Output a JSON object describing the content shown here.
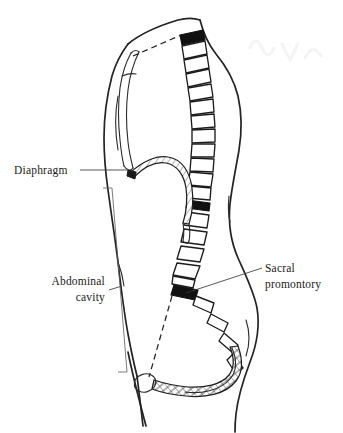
{
  "figure": {
    "background_color": "#ffffff",
    "line_color": "#232323",
    "accent_color": "#111111",
    "width": 343,
    "height": 433
  },
  "labels": {
    "diaphragm": {
      "text": "Diaphragm",
      "x": 14,
      "y": 174,
      "anchor": "start"
    },
    "abdominal_cavity_line1": {
      "text": "Abdominal",
      "x": 105,
      "y": 285,
      "anchor": "end"
    },
    "abdominal_cavity_line2": {
      "text": "cavity",
      "x": 105,
      "y": 301,
      "anchor": "end"
    },
    "sacral_promontory_line1": {
      "text": "Sacral",
      "x": 265,
      "y": 272,
      "anchor": "start"
    },
    "sacral_promontory_line2": {
      "text": "promontory",
      "x": 265,
      "y": 288,
      "anchor": "start"
    }
  },
  "structures": {
    "body_outline": "sagittal torso silhouette, head to thigh",
    "sternum": "elongated bone at anterior upper thorax",
    "vertebral_column": "chain of 18 vertebral bodies curving down the posterior",
    "diaphragm": "hatched arched band forming the dome",
    "sacrum": "hatched curved band forming posterior pelvic wall",
    "pubic_symphysis": "oval at anterior inferior pelvis",
    "pelvic_inlet": "dashed line from sacral promontory to pubic symphysis",
    "thoracic_inlet": "dashed line from sternum to first vertebra"
  },
  "vertebrae": {
    "count": 18,
    "black_indices": [
      0,
      11,
      16
    ],
    "fill_color": "#ffffff",
    "black_fill_color": "#111111",
    "stroke_color": "#1c1c1c"
  },
  "bracket": {
    "name": "abdominal-cavity-bracket",
    "top_y": 188,
    "bottom_y": 372,
    "x": 112
  }
}
